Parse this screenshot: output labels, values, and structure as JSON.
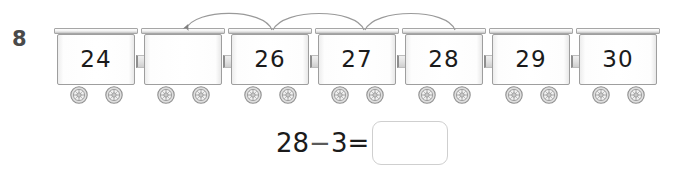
{
  "worksheet": {
    "question_number": "8",
    "type": "number-line-train-subtraction"
  },
  "train": {
    "wagons": [
      {
        "label": "24",
        "filled": true
      },
      {
        "label": "",
        "filled": false
      },
      {
        "label": "26",
        "filled": true
      },
      {
        "label": "27",
        "filled": true
      },
      {
        "label": "28",
        "filled": true
      },
      {
        "label": "29",
        "filled": true
      },
      {
        "label": "30",
        "filled": true
      }
    ]
  },
  "arrows": {
    "count": 3,
    "direction": "backward",
    "description": "three backward hops from 28 to 25"
  },
  "equation": {
    "left_operand": "28",
    "operator": "−",
    "right_operand": "3",
    "equals": "=",
    "answer": "",
    "answer_placeholder": ""
  },
  "colors": {
    "wagon_border": "#9e9e9e",
    "wagon_rail": "#c2c2c2",
    "number_text": "#1b1b1b",
    "question_number": "#4a4a4a",
    "arrow": "#808080",
    "answer_box_border": "#cfcfcf",
    "background": "#ffffff"
  }
}
